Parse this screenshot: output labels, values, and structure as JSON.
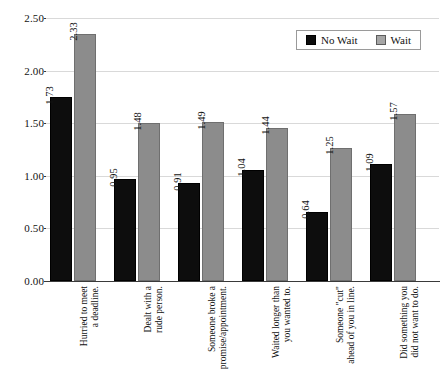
{
  "chart_data": {
    "type": "bar",
    "title": "",
    "xlabel": "",
    "ylabel": "",
    "ylim": [
      0,
      2.5
    ],
    "yticks": [
      "0.00",
      "0.50",
      "1.00",
      "1.50",
      "2.00",
      "2.50"
    ],
    "ytick_values": [
      0,
      0.5,
      1.0,
      1.5,
      2.0,
      2.5
    ],
    "grid": true,
    "legend_position": "top-right",
    "categories": [
      "Hurried to meet a deadline.",
      "Dealt with a rude person.",
      "Someone broke a promise/appointment.",
      "Waited longer than you wanted to.",
      "Someone \"cut\" ahead of you in line.",
      "Did something you did not want to do."
    ],
    "category_lines": [
      [
        "Hurried to meet",
        "a deadline."
      ],
      [
        "Dealt with a",
        "rude person."
      ],
      [
        "Someone broke a",
        "promise/appointment."
      ],
      [
        "Waited longer than",
        "you wanted to."
      ],
      [
        "Someone \"cut\"",
        "ahead of you in line."
      ],
      [
        "Did something you",
        "did not want to do."
      ]
    ],
    "series": [
      {
        "name": "No Wait",
        "color": "#0d0d0d",
        "values": [
          1.73,
          0.95,
          0.91,
          1.04,
          0.64,
          1.09
        ],
        "labels": [
          "1.73",
          "0.95",
          "0.91",
          "1.04",
          "0.64",
          "1.09"
        ]
      },
      {
        "name": "Wait",
        "color": "#8c8c8c",
        "values": [
          2.33,
          1.48,
          1.49,
          1.44,
          1.25,
          1.57
        ],
        "labels": [
          "2.33",
          "1.48",
          "1.49",
          "1.44",
          "1.25",
          "1.57"
        ]
      }
    ]
  },
  "legend": {
    "items": [
      {
        "label": "No Wait"
      },
      {
        "label": "Wait"
      }
    ]
  }
}
